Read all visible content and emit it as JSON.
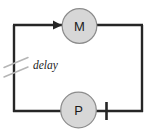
{
  "diagram": {
    "type": "circuit-loop",
    "background_color": "#ffffff",
    "wire_color": "#262626",
    "node_fill_color": "#d7d7d7",
    "node_stroke_color": "#8c8c8c",
    "label_color": "#1a1a1a",
    "break_mark_color": "#b0b0b0",
    "nodes": [
      {
        "id": "motor",
        "label": "M",
        "cx": 79.5,
        "cy": 26,
        "r": 17.5
      },
      {
        "id": "pump",
        "label": "P",
        "cx": 78.5,
        "cy": 110,
        "r": 18
      }
    ],
    "annotations": [
      {
        "id": "delay",
        "label": "delay",
        "x": 35,
        "y": 64
      }
    ],
    "markers": [
      {
        "id": "flow-arrow",
        "shape": "arrowhead",
        "direction": "right",
        "x": 59,
        "y": 25
      },
      {
        "id": "terminal-tick",
        "shape": "vertical-bar",
        "x": 107,
        "y": 110
      },
      {
        "id": "break-slash-upper",
        "shape": "diagonal-slash",
        "x": 13,
        "y": 62
      },
      {
        "id": "break-slash-lower",
        "shape": "diagonal-slash",
        "x": 13,
        "y": 71
      }
    ],
    "loop": {
      "left_x": 13,
      "right_x": 143,
      "top_y": 25,
      "bottom_y": 112
    }
  }
}
